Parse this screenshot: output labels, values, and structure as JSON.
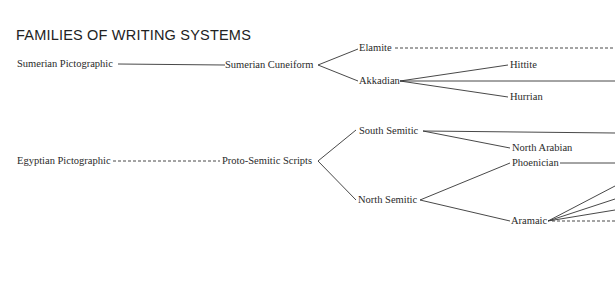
{
  "title": "FAMILIES OF WRITING SYSTEMS",
  "nodes": {
    "sumerian_pictographic": "Sumerian Pictographic",
    "sumerian_cuneiform": "Sumerian Cuneiform",
    "elamite": "Elamite",
    "akkadian": "Akkadian",
    "hittite": "Hittite",
    "hurrian": "Hurrian",
    "egyptian_pictographic": "Egyptian Pictographic",
    "proto_semitic": "Proto-Semitic Scripts",
    "south_semitic": "South Semitic",
    "north_arabian": "North Arabian",
    "north_semitic": "North Semitic",
    "phoenician": "Phoenician",
    "aramaic": "Aramaic"
  },
  "edges": [
    {
      "from": "Sumerian Pictographic",
      "to": "Sumerian Cuneiform",
      "style": "solid"
    },
    {
      "from": "Sumerian Cuneiform",
      "to": "Elamite",
      "style": "solid"
    },
    {
      "from": "Sumerian Cuneiform",
      "to": "Akkadian",
      "style": "solid"
    },
    {
      "from": "Elamite",
      "to": "(off-page right)",
      "style": "dashed"
    },
    {
      "from": "Akkadian",
      "to": "Hittite",
      "style": "solid"
    },
    {
      "from": "Akkadian",
      "to": "(off-page right)",
      "style": "solid"
    },
    {
      "from": "Akkadian",
      "to": "Hurrian",
      "style": "solid"
    },
    {
      "from": "Egyptian Pictographic",
      "to": "Proto-Semitic Scripts",
      "style": "dashed"
    },
    {
      "from": "Proto-Semitic Scripts",
      "to": "South Semitic",
      "style": "solid"
    },
    {
      "from": "Proto-Semitic Scripts",
      "to": "North Semitic",
      "style": "solid"
    },
    {
      "from": "South Semitic",
      "to": "(off-page right)",
      "style": "solid"
    },
    {
      "from": "South Semitic",
      "to": "North Arabian",
      "style": "solid"
    },
    {
      "from": "North Semitic",
      "to": "Phoenician",
      "style": "solid"
    },
    {
      "from": "North Semitic",
      "to": "Aramaic",
      "style": "solid"
    },
    {
      "from": "Phoenician",
      "to": "(off-page right)",
      "style": "solid"
    },
    {
      "from": "Aramaic",
      "to": "(off-page right) x3",
      "style": "solid"
    },
    {
      "from": "Aramaic",
      "to": "(off-page right)",
      "style": "dashed"
    }
  ]
}
